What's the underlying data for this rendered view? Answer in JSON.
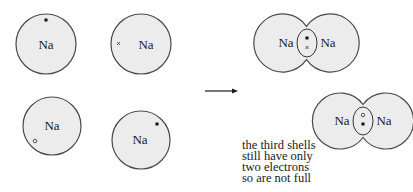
{
  "colors": {
    "shell_fill": "#ececec",
    "shell_stroke": "#4a4a4a",
    "ink": "#1a1a1a",
    "background": "#ffffff"
  },
  "atoms": [
    {
      "label": "Na",
      "electron": "dot",
      "electron_position": "top"
    },
    {
      "label": "Na",
      "electron": "cross",
      "electron_position": "left"
    },
    {
      "label": "Na",
      "electron": "open-circle",
      "electron_position": "bottom-left"
    },
    {
      "label": "Na",
      "electron": "dot",
      "electron_position": "top-right"
    }
  ],
  "arrow": {
    "direction": "right"
  },
  "molecules": [
    {
      "left_label": "Na",
      "right_label": "Na",
      "shared_electrons": [
        "dot",
        "cross"
      ]
    },
    {
      "left_label": "Na",
      "right_label": "Na",
      "shared_electrons": [
        "open-circle",
        "dot"
      ]
    }
  ],
  "note": {
    "lines": [
      "the third shells",
      "still have only",
      "two electrons",
      "so are not full"
    ]
  }
}
